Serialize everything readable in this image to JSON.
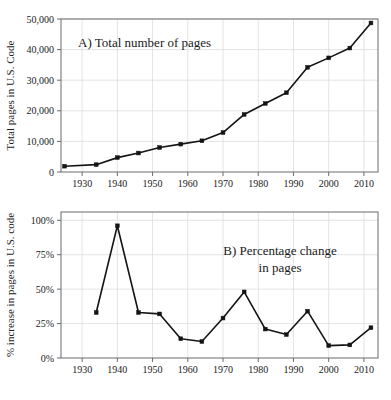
{
  "figure": {
    "background_color": "#ffffff",
    "line_color": "#141414",
    "grid_color": "#d9d9d9",
    "frame_color": "#6b6b6b"
  },
  "chart_data": [
    {
      "type": "line",
      "panel": "A",
      "title": "A) Total number of pages",
      "xlabel": "",
      "ylabel": "Total pages in U.S. Code",
      "xlim": [
        1924,
        2014
      ],
      "ylim": [
        0,
        50000
      ],
      "grid": true,
      "legend": "none",
      "xticks": [
        1930,
        1940,
        1950,
        1960,
        1970,
        1980,
        1990,
        2000,
        2010
      ],
      "xticklabels": [
        "1930",
        "1940",
        "1950",
        "1960",
        "1970",
        "1980",
        "1990",
        "2000",
        "2010"
      ],
      "yticks": [
        0,
        10000,
        20000,
        30000,
        40000,
        50000
      ],
      "yticklabels": [
        "0",
        "10,000",
        "20,000",
        "30,000",
        "40,000",
        "50,000"
      ],
      "x": [
        1925,
        1934,
        1940,
        1946,
        1952,
        1958,
        1964,
        1970,
        1976,
        1982,
        1988,
        1994,
        2000,
        2006,
        2012
      ],
      "values": [
        1900,
        2400,
        4700,
        6200,
        8000,
        9100,
        10200,
        12900,
        18800,
        22400,
        25900,
        34200,
        37300,
        40500,
        48700
      ]
    },
    {
      "type": "line",
      "panel": "B",
      "title_line1": "B) Percentage change",
      "title_line2": "in pages",
      "xlabel": "",
      "ylabel": "% increase in pages in U.S. code",
      "xlim": [
        1924,
        2014
      ],
      "ylim": [
        0,
        106
      ],
      "grid": true,
      "legend": "none",
      "xticks": [
        1930,
        1940,
        1950,
        1960,
        1970,
        1980,
        1990,
        2000,
        2010
      ],
      "xticklabels": [
        "1930",
        "1940",
        "1950",
        "1960",
        "1970",
        "1980",
        "1990",
        "2000",
        "2010"
      ],
      "yticks": [
        0,
        25,
        50,
        75,
        100
      ],
      "yticklabels": [
        "0%",
        "25%",
        "50%",
        "75%",
        "100%"
      ],
      "x": [
        1934,
        1940,
        1946,
        1952,
        1958,
        1964,
        1970,
        1976,
        1982,
        1988,
        1994,
        2000,
        2006,
        2012
      ],
      "values": [
        33,
        96,
        33,
        32,
        14,
        12,
        29,
        48,
        21,
        17,
        34,
        9,
        9.5,
        22
      ]
    }
  ]
}
